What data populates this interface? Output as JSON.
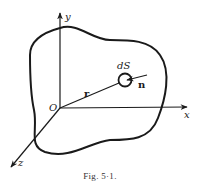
{
  "figure": {
    "caption": "Fig. 5·1.",
    "labels": {
      "origin": "O",
      "x_axis": "x",
      "y_axis": "y",
      "z_axis": "z",
      "position_vector": "r",
      "surface_element": "dS",
      "normal_vector": "n"
    },
    "colors": {
      "stroke": "#1a1a1a",
      "background": "#ffffff"
    }
  }
}
